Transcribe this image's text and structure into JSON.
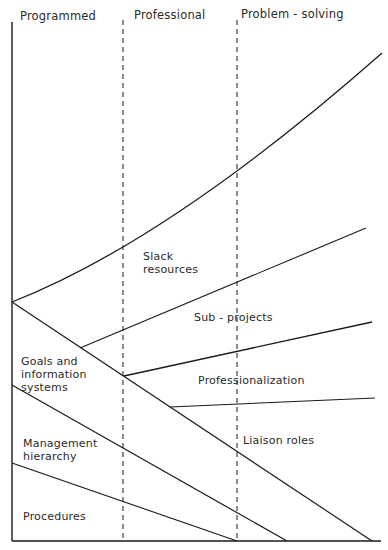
{
  "diagram": {
    "type": "conceptual-diagram",
    "columns": [
      {
        "label": "Programmed"
      },
      {
        "label": "Professional"
      },
      {
        "label": "Problem - solving"
      }
    ],
    "regions": [
      {
        "label_line1": "Slack",
        "label_line2": "resources"
      },
      {
        "label": "Sub - projects"
      },
      {
        "label": "Professionalization"
      },
      {
        "label_line1": "Goals and",
        "label_line2": "information",
        "label_line3": "systems"
      },
      {
        "label": "Liaison roles"
      },
      {
        "label_line1": "Management",
        "label_line2": "hierarchy"
      },
      {
        "label": "Procedures"
      }
    ],
    "colors": {
      "line": "#1a1a1a",
      "text": "#2a2a2a",
      "background": "#ffffff"
    }
  }
}
